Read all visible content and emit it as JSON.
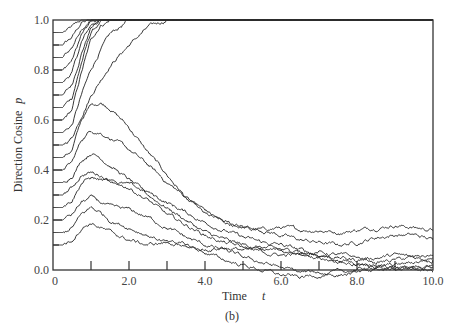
{
  "chart_data": {
    "type": "line",
    "title": "",
    "caption": "(b)",
    "xlabel": "Time",
    "xlabel_symbol": "t",
    "ylabel": "Direction Cosine",
    "ylabel_symbol": "p",
    "xlim": [
      0,
      10
    ],
    "ylim": [
      0,
      1
    ],
    "grid": false,
    "legend": "none",
    "x_ticks": [
      0,
      2,
      4,
      6,
      8,
      10
    ],
    "x_tick_labels": [
      "0",
      "2.0",
      "4.0",
      "6.0",
      "8.0",
      "10.0"
    ],
    "x_minor_ticks": [
      1,
      3,
      5,
      7,
      9
    ],
    "y_ticks": [
      0,
      0.2,
      0.4,
      0.6,
      0.8,
      1.0
    ],
    "y_tick_labels": [
      "0.0",
      "0.2",
      "0.4",
      "0.6",
      "0.8",
      "1.0"
    ],
    "y_minor_ticks": [
      0.1,
      0.3,
      0.5,
      0.7,
      0.9
    ],
    "x": [
      0,
      0.25,
      0.5,
      0.75,
      1.0,
      1.25,
      1.5,
      2.0,
      2.5,
      3.0,
      3.5,
      4.0,
      4.5,
      5.0,
      5.5,
      6.0,
      6.5,
      7.0,
      7.5,
      8.0,
      8.5,
      9.0,
      9.5,
      10.0
    ],
    "series": [
      {
        "name": "p0=0.95",
        "values": [
          0.95,
          0.95,
          0.97,
          1.0,
          1.0,
          1.0,
          1.0,
          1.0,
          1.0,
          1.0,
          1.0,
          1.0,
          1.0,
          1.0,
          1.0,
          1.0,
          1.0,
          1.0,
          1.0,
          1.0,
          1.0,
          1.0,
          1.0,
          1.0
        ]
      },
      {
        "name": "p0=0.90",
        "values": [
          0.9,
          0.9,
          0.93,
          0.99,
          1.0,
          1.0,
          1.0,
          1.0,
          1.0,
          1.0,
          1.0,
          1.0,
          1.0,
          1.0,
          1.0,
          1.0,
          1.0,
          1.0,
          1.0,
          1.0,
          1.0,
          1.0,
          1.0,
          1.0
        ]
      },
      {
        "name": "p0=0.85",
        "values": [
          0.85,
          0.85,
          0.89,
          0.97,
          1.0,
          1.0,
          1.0,
          1.0,
          1.0,
          1.0,
          1.0,
          1.0,
          1.0,
          1.0,
          1.0,
          1.0,
          1.0,
          1.0,
          1.0,
          1.0,
          1.0,
          1.0,
          1.0,
          1.0
        ]
      },
      {
        "name": "p0=0.80",
        "values": [
          0.8,
          0.8,
          0.84,
          0.94,
          0.99,
          1.0,
          1.0,
          1.0,
          1.0,
          1.0,
          1.0,
          1.0,
          1.0,
          1.0,
          1.0,
          1.0,
          1.0,
          1.0,
          1.0,
          1.0,
          1.0,
          1.0,
          1.0,
          1.0
        ]
      },
      {
        "name": "p0=0.75",
        "values": [
          0.75,
          0.75,
          0.79,
          0.91,
          0.98,
          1.0,
          1.0,
          1.0,
          1.0,
          1.0,
          1.0,
          1.0,
          1.0,
          1.0,
          1.0,
          1.0,
          1.0,
          1.0,
          1.0,
          1.0,
          1.0,
          1.0,
          1.0,
          1.0
        ]
      },
      {
        "name": "p0=0.70",
        "values": [
          0.7,
          0.7,
          0.74,
          0.87,
          0.97,
          1.0,
          1.0,
          1.0,
          1.0,
          1.0,
          1.0,
          1.0,
          1.0,
          1.0,
          1.0,
          1.0,
          1.0,
          1.0,
          1.0,
          1.0,
          1.0,
          1.0,
          1.0,
          1.0
        ]
      },
      {
        "name": "p0=0.65",
        "values": [
          0.65,
          0.65,
          0.69,
          0.83,
          0.95,
          0.99,
          1.0,
          1.0,
          1.0,
          1.0,
          1.0,
          1.0,
          1.0,
          1.0,
          1.0,
          1.0,
          1.0,
          1.0,
          1.0,
          1.0,
          1.0,
          1.0,
          1.0,
          1.0
        ]
      },
      {
        "name": "p0=0.60",
        "values": [
          0.6,
          0.6,
          0.64,
          0.79,
          0.92,
          0.98,
          1.0,
          1.0,
          1.0,
          1.0,
          1.0,
          1.0,
          1.0,
          1.0,
          1.0,
          1.0,
          1.0,
          1.0,
          1.0,
          1.0,
          1.0,
          1.0,
          1.0,
          1.0
        ]
      },
      {
        "name": "p0=0.55",
        "values": [
          0.55,
          0.55,
          0.58,
          0.7,
          0.8,
          0.88,
          0.94,
          1.0,
          1.0,
          1.0,
          1.0,
          1.0,
          1.0,
          1.0,
          1.0,
          1.0,
          1.0,
          1.0,
          1.0,
          1.0,
          1.0,
          1.0,
          1.0,
          1.0
        ]
      },
      {
        "name": "p0=0.50",
        "values": [
          0.5,
          0.5,
          0.53,
          0.62,
          0.7,
          0.76,
          0.82,
          0.9,
          0.97,
          1.0,
          1.0,
          1.0,
          1.0,
          1.0,
          1.0,
          1.0,
          1.0,
          1.0,
          1.0,
          1.0,
          1.0,
          1.0,
          1.0,
          1.0
        ]
      },
      {
        "name": "p0=0.45",
        "values": [
          0.45,
          0.45,
          0.48,
          0.6,
          0.66,
          0.67,
          0.65,
          0.57,
          0.47,
          0.38,
          0.29,
          0.22,
          0.19,
          0.17,
          0.16,
          0.17,
          0.16,
          0.16,
          0.15,
          0.16,
          0.17,
          0.18,
          0.17,
          0.16
        ]
      },
      {
        "name": "p0=0.40",
        "values": [
          0.4,
          0.4,
          0.43,
          0.52,
          0.56,
          0.55,
          0.53,
          0.48,
          0.42,
          0.35,
          0.29,
          0.24,
          0.19,
          0.17,
          0.16,
          0.14,
          0.12,
          0.11,
          0.1,
          0.11,
          0.13,
          0.14,
          0.14,
          0.12
        ]
      },
      {
        "name": "p0=0.35",
        "values": [
          0.35,
          0.35,
          0.38,
          0.44,
          0.47,
          0.45,
          0.42,
          0.36,
          0.3,
          0.25,
          0.2,
          0.15,
          0.12,
          0.1,
          0.09,
          0.08,
          0.07,
          0.06,
          0.04,
          0.03,
          0.02,
          0.01,
          0.0,
          0.01
        ]
      },
      {
        "name": "p0=0.30",
        "values": [
          0.3,
          0.3,
          0.33,
          0.38,
          0.39,
          0.38,
          0.36,
          0.34,
          0.31,
          0.27,
          0.23,
          0.19,
          0.16,
          0.13,
          0.11,
          0.1,
          0.08,
          0.06,
          0.05,
          0.04,
          0.05,
          0.06,
          0.05,
          0.04
        ]
      },
      {
        "name": "p0=0.25",
        "values": [
          0.25,
          0.25,
          0.28,
          0.35,
          0.37,
          0.36,
          0.35,
          0.33,
          0.28,
          0.22,
          0.18,
          0.14,
          0.11,
          0.09,
          0.08,
          0.08,
          0.07,
          0.07,
          0.06,
          0.05,
          0.03,
          0.04,
          0.05,
          0.06
        ]
      },
      {
        "name": "p0=0.20",
        "values": [
          0.2,
          0.2,
          0.22,
          0.27,
          0.29,
          0.27,
          0.25,
          0.24,
          0.21,
          0.17,
          0.13,
          0.1,
          0.08,
          0.05,
          0.03,
          0.01,
          -0.01,
          -0.01,
          -0.02,
          -0.01,
          0.0,
          0.01,
          0.0,
          -0.01
        ]
      },
      {
        "name": "p0=0.15",
        "values": [
          0.15,
          0.15,
          0.17,
          0.22,
          0.25,
          0.23,
          0.2,
          0.17,
          0.14,
          0.11,
          0.09,
          0.08,
          0.09,
          0.08,
          0.07,
          0.06,
          0.06,
          0.05,
          0.04,
          0.02,
          0.01,
          0.02,
          0.03,
          0.05
        ]
      },
      {
        "name": "p0=0.10",
        "values": [
          0.1,
          0.1,
          0.12,
          0.17,
          0.19,
          0.17,
          0.15,
          0.12,
          0.1,
          0.11,
          0.1,
          0.07,
          0.04,
          0.02,
          0.0,
          -0.02,
          -0.03,
          -0.02,
          -0.01,
          0.0,
          0.01,
          0.0,
          0.01,
          0.02
        ]
      }
    ]
  }
}
